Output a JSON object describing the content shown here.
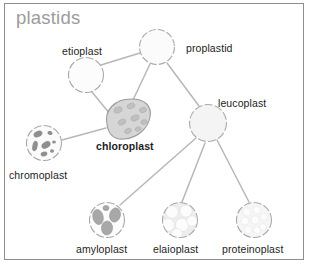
{
  "frame": {
    "border_color": "#8d8d8d",
    "background": "#ffffff"
  },
  "title": {
    "text": "plastids",
    "color": "#9b9b9b"
  },
  "colors": {
    "line": "#b7b7b7",
    "outline": "#a9a9a9",
    "label": "#1d1d1d",
    "chloroplast_fill": "#d6d6d6",
    "chloroplast_grana": "#c0c0c0",
    "chromoplast_blob": "#8f8f8f",
    "amyloplast_grain": "#a8a8a8",
    "pale_fill": "#f2f2f2",
    "inclusion_fill": "#fbfbfb"
  },
  "nodes": [
    {
      "id": "proplastid",
      "label": "proplastid",
      "icon": "plain-circle-organelle",
      "cx": 157,
      "cy": 47,
      "r": 18,
      "label_x": 186,
      "label_y": 43,
      "bold": false
    },
    {
      "id": "etioplast",
      "label": "etioplast",
      "icon": "plain-circle-organelle",
      "cx": 86,
      "cy": 75,
      "r": 18,
      "label_x": 62,
      "label_y": 46,
      "bold": false
    },
    {
      "id": "chloroplast",
      "label": "chloroplast",
      "icon": "bean-shaped-organelle",
      "cx": 126,
      "cy": 119,
      "r": 20,
      "label_x": 96,
      "label_y": 141,
      "bold": true
    },
    {
      "id": "chromoplast",
      "label": "chromoplast",
      "icon": "blob-inclusion-organelle",
      "cx": 44,
      "cy": 143,
      "r": 18,
      "label_x": 9,
      "label_y": 170,
      "bold": false
    },
    {
      "id": "leucoplast",
      "label": "leucoplast",
      "icon": "plain-circle-organelle",
      "cx": 208,
      "cy": 123,
      "r": 19,
      "label_x": 218,
      "label_y": 98,
      "bold": false
    },
    {
      "id": "amyloplast",
      "label": "amyloplast",
      "icon": "starch-grain-organelle",
      "cx": 107,
      "cy": 220,
      "r": 18,
      "label_x": 76,
      "label_y": 244,
      "bold": false
    },
    {
      "id": "elaioplast",
      "label": "elaioplast",
      "icon": "lipid-droplet-organelle",
      "cx": 180,
      "cy": 220,
      "r": 18,
      "label_x": 153,
      "label_y": 244,
      "bold": false
    },
    {
      "id": "proteinoplast",
      "label": "proteinoplast",
      "icon": "protein-body-organelle",
      "cx": 254,
      "cy": 220,
      "r": 18,
      "label_x": 222,
      "label_y": 244,
      "bold": false
    }
  ],
  "edges": [
    {
      "from": "proplastid",
      "to": "etioplast",
      "x1": 140,
      "y1": 53,
      "x2": 101,
      "y2": 65
    },
    {
      "from": "proplastid",
      "to": "chloroplast",
      "x1": 150,
      "y1": 64,
      "x2": 133,
      "y2": 100
    },
    {
      "from": "proplastid",
      "to": "leucoplast",
      "x1": 167,
      "y1": 63,
      "x2": 199,
      "y2": 106
    },
    {
      "from": "etioplast",
      "to": "chloroplast",
      "x1": 92,
      "y1": 92,
      "x2": 110,
      "y2": 114
    },
    {
      "from": "chloroplast",
      "to": "chromoplast",
      "x1": 106,
      "y1": 128,
      "x2": 62,
      "y2": 140
    },
    {
      "from": "leucoplast",
      "to": "amyloplast",
      "x1": 196,
      "y1": 138,
      "x2": 120,
      "y2": 205
    },
    {
      "from": "leucoplast",
      "to": "elaioplast",
      "x1": 205,
      "y1": 143,
      "x2": 182,
      "y2": 202
    },
    {
      "from": "leucoplast",
      "to": "proteinoplast",
      "x1": 217,
      "y1": 140,
      "x2": 249,
      "y2": 202
    }
  ]
}
